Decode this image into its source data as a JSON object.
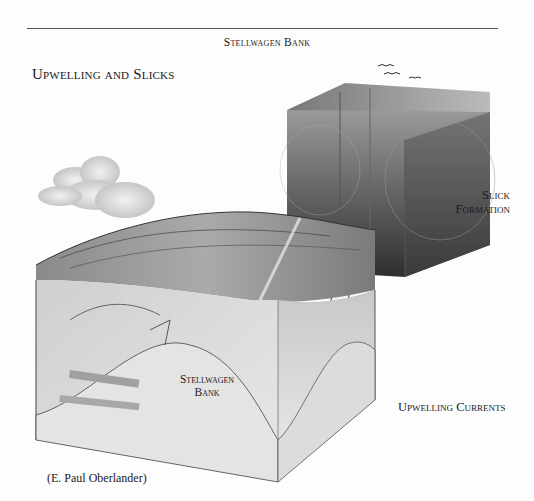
{
  "header": {
    "running_head": "Stellwagen Bank"
  },
  "figure": {
    "title": "Upwelling and Slicks",
    "labels": {
      "slick_formation_line1": "Slick",
      "slick_formation_line2": "Formation",
      "bank_line1": "Stellwagen",
      "bank_line2": "Bank",
      "upwelling_currents": "Upwelling Currents"
    },
    "credit": "(E. Paul Oberlander)",
    "colors": {
      "rule": "#555555",
      "ink": "#1a1a1a",
      "dark_block": "#3a3a3a",
      "seafloor": "#d8d8d8"
    }
  }
}
